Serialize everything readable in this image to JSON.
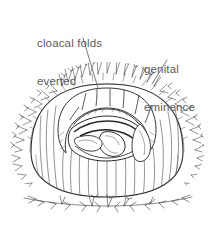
{
  "figure": {
    "background_color": "#ffffff",
    "ink_color": "#2b2b2b",
    "label_color": "#5b5b5b",
    "width": 214,
    "height": 233
  },
  "labels": [
    {
      "id": "cloacal-folds",
      "line1": "cloacal folds",
      "line2": "everted",
      "leader": {
        "x1": 83,
        "y1": 38,
        "x2": 98,
        "y2": 88
      }
    },
    {
      "id": "genital-eminence",
      "line1": "genital",
      "line2": "eminence",
      "leader": {
        "x1": 167,
        "y1": 60,
        "x2": 152,
        "y2": 84
      }
    }
  ],
  "drawing": {
    "subject": "everted cloaca",
    "parts": [
      "cloacal folds",
      "genital eminence",
      "cloacal mound",
      "feather bristles",
      "ground line"
    ]
  }
}
